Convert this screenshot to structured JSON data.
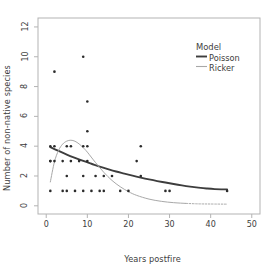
{
  "chart_data": {
    "type": "scatter",
    "title": "",
    "xlabel": "Years postfire",
    "ylabel": "Number of non-native species",
    "xlim": [
      -2,
      52
    ],
    "ylim": [
      -0.55,
      12.6
    ],
    "xticks": [
      0,
      10,
      20,
      30,
      40,
      50
    ],
    "yticks": [
      0,
      2,
      4,
      6,
      8,
      10,
      12
    ],
    "grid": false,
    "legend": {
      "title": "Model",
      "position": "top-right",
      "entries": [
        {
          "name": "Poisson",
          "color": "#3d3d3d",
          "width": 1.9
        },
        {
          "name": "Ricker",
          "color": "#a8a8a8",
          "width": 1.1
        }
      ]
    },
    "points": {
      "marker": "dot",
      "color": "#2b2b2b",
      "size": 1.9,
      "x": [
        2,
        9,
        10,
        10,
        1,
        2,
        5,
        6,
        9,
        10,
        23,
        1,
        1,
        2,
        4,
        6,
        8,
        10,
        22,
        5,
        9,
        12,
        14,
        16,
        23,
        1,
        4,
        5,
        7,
        9,
        11,
        13,
        14,
        18,
        20,
        29,
        30,
        44
      ],
      "y": [
        9,
        10,
        7,
        5,
        4,
        4,
        4,
        4,
        4,
        4,
        4,
        3,
        3,
        3,
        3,
        3,
        3,
        3,
        3,
        2,
        2,
        2,
        2,
        2,
        2,
        1,
        1,
        1,
        1,
        1,
        1,
        1,
        1,
        1,
        1,
        1,
        1,
        1
      ]
    },
    "series": [
      {
        "name": "Poisson",
        "type": "line",
        "color": "#3d3d3d",
        "x": [
          1,
          3,
          5,
          7,
          9,
          11,
          13,
          15,
          17,
          19,
          21,
          23,
          25,
          27,
          29,
          31,
          33,
          35,
          37,
          39,
          41,
          44
        ],
        "y": [
          3.93,
          3.68,
          3.44,
          3.22,
          3.01,
          2.82,
          2.63,
          2.46,
          2.3,
          2.16,
          2.02,
          1.89,
          1.77,
          1.66,
          1.56,
          1.46,
          1.37,
          1.29,
          1.22,
          1.16,
          1.12,
          1.1
        ]
      },
      {
        "name": "Ricker",
        "type": "line",
        "color": "#a8a8a8",
        "x": [
          1,
          2,
          3,
          4,
          5,
          6,
          7,
          8,
          9,
          10,
          12,
          14,
          16,
          18,
          20,
          22,
          25,
          28,
          31,
          34,
          37,
          40,
          44
        ],
        "y": [
          1.6,
          2.95,
          3.72,
          4.14,
          4.34,
          4.4,
          4.33,
          4.15,
          3.9,
          3.6,
          2.9,
          2.25,
          1.7,
          1.28,
          0.95,
          0.7,
          0.45,
          0.3,
          0.21,
          0.16,
          0.13,
          0.12,
          0.11
        ]
      }
    ],
    "ricker_dashed_from_x": 33
  }
}
